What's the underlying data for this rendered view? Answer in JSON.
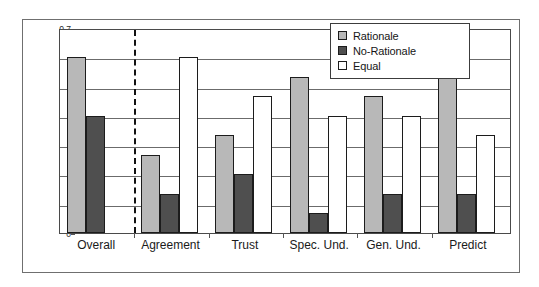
{
  "figure": {
    "frame_color": "#6f6f6f",
    "background": "#ffffff"
  },
  "axis": {
    "ylabel": "% of participants",
    "yticks": [
      "0.7",
      "0.6",
      "0.5",
      "0.4",
      "0.3",
      "0.2",
      "0.1",
      "0"
    ]
  },
  "legend": {
    "items": [
      {
        "label": "Rationale",
        "color": "#b8b8b8"
      },
      {
        "label": "No-Rationale",
        "color": "#4f4f4f"
      },
      {
        "label": "Equal",
        "color": "#ffffff"
      }
    ]
  },
  "chart_data": {
    "type": "bar",
    "title": "",
    "xlabel": "",
    "ylabel": "% of participants",
    "ylim": [
      0,
      0.7
    ],
    "ytick_values": [
      0,
      0.1,
      0.2,
      0.3,
      0.4,
      0.5,
      0.6,
      0.7
    ],
    "grid": true,
    "legend_position": "top-right",
    "categories": [
      "Overall",
      "Agreement",
      "Trust",
      "Spec. Und.",
      "Gen. Und.",
      "Predict"
    ],
    "series": [
      {
        "name": "Rationale",
        "color": "#b8b8b8",
        "values": [
          0.6,
          0.267,
          0.333,
          0.533,
          0.467,
          0.533
        ]
      },
      {
        "name": "No-Rationale",
        "color": "#4f4f4f",
        "values": [
          0.4,
          0.133,
          0.2,
          0.067,
          0.133,
          0.133
        ]
      },
      {
        "name": "Equal",
        "color": "#ffffff",
        "values": [
          0,
          0.6,
          0.467,
          0.4,
          0.4,
          0.333
        ]
      }
    ],
    "annotations": [
      {
        "type": "vertical-dashed-line",
        "after_category": "Overall",
        "note": "separates Overall from per-question results"
      }
    ]
  }
}
